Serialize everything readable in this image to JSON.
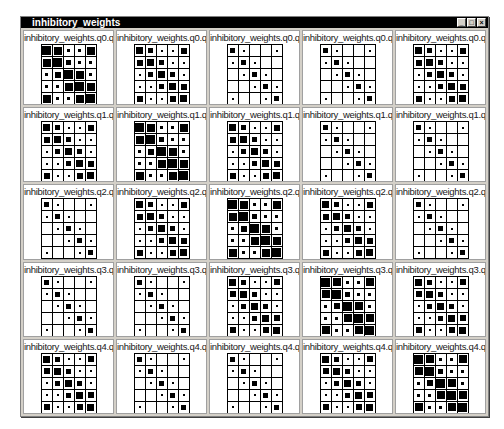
{
  "window": {
    "title": "inhibitory_weights",
    "controls": [
      {
        "name": "minimize",
        "glyph": "_"
      },
      {
        "name": "maximize",
        "glyph": "□"
      },
      {
        "name": "close",
        "glyph": "×"
      }
    ]
  },
  "patterns": {
    "dense": [
      [
        0.95,
        0.85,
        0.3,
        0.3,
        0.9
      ],
      [
        0.9,
        0.95,
        0.6,
        0.3,
        0.3
      ],
      [
        0.3,
        0.7,
        0.95,
        0.85,
        0.3
      ],
      [
        0.3,
        0.3,
        0.85,
        0.95,
        0.85
      ],
      [
        0.85,
        0.3,
        0.3,
        0.85,
        0.95
      ]
    ],
    "medium": [
      [
        0.8,
        0.6,
        0.15,
        0.15,
        0.7
      ],
      [
        0.7,
        0.8,
        0.5,
        0.15,
        0.15
      ],
      [
        0.15,
        0.6,
        0.8,
        0.6,
        0.15
      ],
      [
        0.15,
        0.15,
        0.6,
        0.8,
        0.7
      ],
      [
        0.7,
        0.15,
        0.15,
        0.7,
        0.8
      ]
    ],
    "sparse": [
      [
        0.5,
        0.15,
        0,
        0,
        0.15
      ],
      [
        0.15,
        0.5,
        0.15,
        0,
        0
      ],
      [
        0,
        0.15,
        0.5,
        0.15,
        0
      ],
      [
        0,
        0,
        0.15,
        0.5,
        0.15
      ],
      [
        0.15,
        0,
        0,
        0.15,
        0.5
      ]
    ]
  },
  "panels": [
    {
      "label": "inhibitory_weights.q0.q00",
      "pattern": "dense"
    },
    {
      "label": "inhibitory_weights.q0.q01",
      "pattern": "medium"
    },
    {
      "label": "inhibitory_weights.q0.q02",
      "pattern": "sparse"
    },
    {
      "label": "inhibitory_weights.q0.q03",
      "pattern": "sparse"
    },
    {
      "label": "inhibitory_weights.q0.q04",
      "pattern": "medium"
    },
    {
      "label": "inhibitory_weights.q1.q10",
      "pattern": "medium"
    },
    {
      "label": "inhibitory_weights.q1.q11",
      "pattern": "dense"
    },
    {
      "label": "inhibitory_weights.q1.q12",
      "pattern": "medium"
    },
    {
      "label": "inhibitory_weights.q1.q13",
      "pattern": "sparse"
    },
    {
      "label": "inhibitory_weights.q1.q14",
      "pattern": "sparse"
    },
    {
      "label": "inhibitory_weights.q2.q20",
      "pattern": "sparse"
    },
    {
      "label": "inhibitory_weights.q2.q21",
      "pattern": "medium"
    },
    {
      "label": "inhibitory_weights.q2.q22",
      "pattern": "dense"
    },
    {
      "label": "inhibitory_weights.q2.q23",
      "pattern": "medium"
    },
    {
      "label": "inhibitory_weights.q2.q24",
      "pattern": "sparse"
    },
    {
      "label": "inhibitory_weights.q3.q30",
      "pattern": "sparse"
    },
    {
      "label": "inhibitory_weights.q3.q31",
      "pattern": "sparse"
    },
    {
      "label": "inhibitory_weights.q3.q32",
      "pattern": "medium"
    },
    {
      "label": "inhibitory_weights.q3.q33",
      "pattern": "dense"
    },
    {
      "label": "inhibitory_weights.q3.q34",
      "pattern": "medium"
    },
    {
      "label": "inhibitory_weights.q4.q40",
      "pattern": "medium"
    },
    {
      "label": "inhibitory_weights.q4.q41",
      "pattern": "sparse"
    },
    {
      "label": "inhibitory_weights.q4.q42",
      "pattern": "sparse"
    },
    {
      "label": "inhibitory_weights.q4.q43",
      "pattern": "medium"
    },
    {
      "label": "inhibitory_weights.q4.q44",
      "pattern": "dense"
    }
  ]
}
